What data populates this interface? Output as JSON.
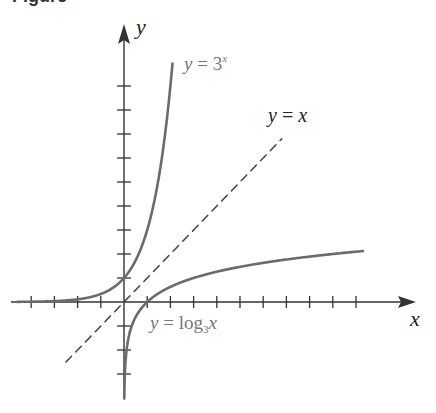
{
  "figure": {
    "title_fragment": "Figure",
    "axes": {
      "x_label": "x",
      "y_label": "y"
    },
    "labels": {
      "exp": {
        "lhs": "y",
        "eq": " = ",
        "base": "3",
        "exp": "x"
      },
      "identity": {
        "lhs": "y",
        "eq": " = ",
        "rhs": "x"
      },
      "log": {
        "lhs": "y",
        "eq": " = ",
        "fn": "log",
        "base": "3",
        "arg": "x"
      }
    },
    "colors": {
      "curve": "#6b6b6b",
      "axis": "#333333",
      "dashed": "#444444",
      "label_gray": "#777777",
      "label_dark": "#222222"
    }
  },
  "chart_data": {
    "type": "line",
    "title": "",
    "xlabel": "x",
    "ylabel": "y",
    "xlim": [
      -4.8,
      12.5
    ],
    "ylim": [
      -4,
      10.5
    ],
    "grid": false,
    "ticks": {
      "x": [
        -4,
        -3,
        -2,
        -1,
        1,
        2,
        3,
        4,
        5,
        6,
        7,
        8,
        9,
        10
      ],
      "y": [
        -3,
        -2,
        -1,
        1,
        2,
        3,
        4,
        5,
        6,
        7,
        8,
        9
      ]
    },
    "series": [
      {
        "name": "y = 3^x",
        "style": "solid",
        "function": "3^x",
        "x_range": [
          -4.6,
          2.09
        ]
      },
      {
        "name": "y = x",
        "style": "dashed",
        "function": "x",
        "x_range": [
          -2.5,
          6.8
        ]
      },
      {
        "name": "y = log_3 x",
        "style": "solid",
        "function": "log3(x)",
        "x_range": [
          0.012,
          10.3
        ]
      }
    ],
    "annotations": [
      "y = 3^x",
      "y = x",
      "y = log_3 x"
    ]
  }
}
